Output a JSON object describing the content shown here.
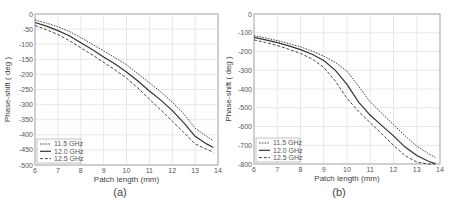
{
  "chart_data": [
    {
      "type": "line",
      "panel_label": "(a)",
      "title": "",
      "xlabel": "Patch length (mm)",
      "ylabel": "Phase-shift ( deg )",
      "xlim": [
        6,
        14
      ],
      "ylim": [
        -500,
        0
      ],
      "xticks": [
        6,
        7,
        8,
        9,
        10,
        11,
        12,
        13,
        14
      ],
      "yticks": [
        0,
        -50,
        -100,
        -150,
        -200,
        -250,
        -300,
        -350,
        -400,
        -450,
        -500
      ],
      "grid": true,
      "legend_position": "lower left",
      "x": [
        6.0,
        6.5,
        7.0,
        7.5,
        8.0,
        8.5,
        9.0,
        9.5,
        10.0,
        10.5,
        11.0,
        11.5,
        12.0,
        12.5,
        13.0,
        13.5,
        13.8
      ],
      "series": [
        {
          "name": "11.5 GHz",
          "style": "dotted",
          "values": [
            -20,
            -30,
            -42,
            -58,
            -78,
            -100,
            -122,
            -145,
            -168,
            -198,
            -228,
            -258,
            -292,
            -330,
            -378,
            -405,
            -420
          ]
        },
        {
          "name": "12.0 GHz",
          "style": "solid",
          "values": [
            -28,
            -40,
            -55,
            -72,
            -95,
            -118,
            -142,
            -166,
            -192,
            -222,
            -255,
            -285,
            -320,
            -360,
            -405,
            -430,
            -442
          ]
        },
        {
          "name": "12.5 GHz",
          "style": "dashed",
          "values": [
            -38,
            -52,
            -68,
            -88,
            -112,
            -135,
            -160,
            -185,
            -212,
            -245,
            -282,
            -318,
            -355,
            -392,
            -430,
            -448,
            -458
          ]
        }
      ]
    },
    {
      "type": "line",
      "panel_label": "(b)",
      "title": "",
      "xlabel": "Patch length (mm)",
      "ylabel": "Phase-shift ( deg )",
      "xlim": [
        6,
        14
      ],
      "ylim": [
        -800,
        0
      ],
      "xticks": [
        6,
        7,
        8,
        9,
        10,
        11,
        12,
        13,
        14
      ],
      "yticks": [
        0,
        -100,
        -200,
        -300,
        -400,
        -500,
        -600,
        -700,
        -800
      ],
      "grid": true,
      "legend_position": "lower left",
      "x": [
        6.0,
        6.5,
        7.0,
        7.5,
        8.0,
        8.5,
        9.0,
        9.5,
        10.0,
        10.5,
        11.0,
        11.5,
        12.0,
        12.5,
        13.0,
        13.5,
        13.8
      ],
      "series": [
        {
          "name": "11.5 GHz",
          "style": "dotted",
          "values": [
            -115,
            -128,
            -142,
            -158,
            -175,
            -198,
            -225,
            -258,
            -305,
            -385,
            -470,
            -530,
            -590,
            -650,
            -705,
            -745,
            -765
          ]
        },
        {
          "name": "12.0 GHz",
          "style": "solid",
          "values": [
            -125,
            -138,
            -153,
            -170,
            -190,
            -215,
            -248,
            -300,
            -375,
            -470,
            -540,
            -595,
            -650,
            -710,
            -755,
            -785,
            -798
          ]
        },
        {
          "name": "12.5 GHz",
          "style": "dashed",
          "values": [
            -138,
            -152,
            -168,
            -188,
            -210,
            -240,
            -285,
            -358,
            -450,
            -520,
            -580,
            -640,
            -700,
            -755,
            -790,
            -800,
            -800
          ]
        }
      ]
    }
  ]
}
